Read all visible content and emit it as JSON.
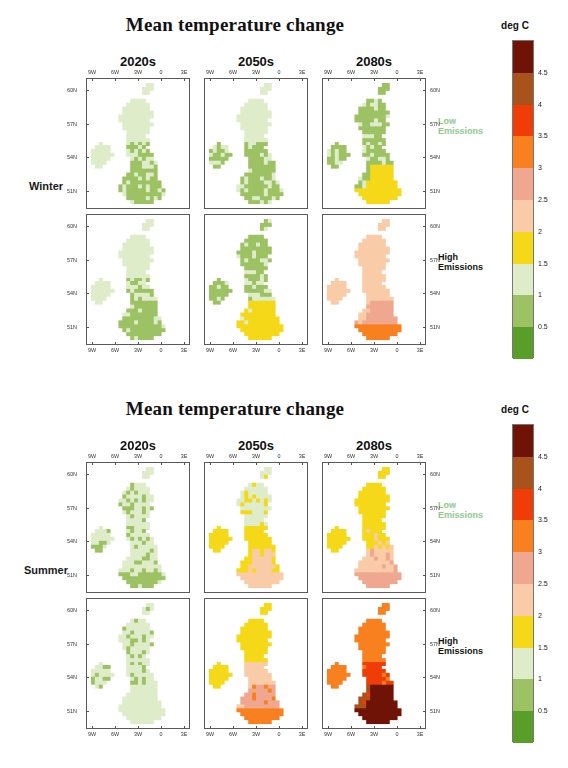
{
  "figures": [
    {
      "id": "winter",
      "title": "Mean temperature change",
      "season_label": "Winter",
      "column_titles": [
        "2020s",
        "2050s",
        "2080s"
      ],
      "row_labels": [
        {
          "text": "Low\nEmissions",
          "style": "low"
        },
        {
          "text": "High\nEmissions",
          "style": "high"
        }
      ],
      "x_ticks": [
        "9W",
        "6W",
        "3W",
        "0",
        "3E"
      ],
      "y_ticks": [
        "60N",
        "57N",
        "54N",
        "51N"
      ],
      "colorbar": {
        "title": "deg C",
        "tick_labels": [
          "4.5",
          "4",
          "3.5",
          "3",
          "2.5",
          "2",
          "1.5",
          "1",
          "0.5"
        ],
        "colors": [
          "#6e1305",
          "#a7531b",
          "#f03c06",
          "#f8801f",
          "#efa88f",
          "#f9cba6",
          "#f5d817",
          "#dfecca",
          "#9cc263",
          "#5a9e2a"
        ]
      }
    },
    {
      "id": "summer",
      "title": "Mean temperature change",
      "season_label": "Summer",
      "column_titles": [
        "2020s",
        "2050s",
        "2080s"
      ],
      "row_labels": [
        {
          "text": "Low\nEmissions",
          "style": "low"
        },
        {
          "text": "High\nEmissions",
          "style": "high"
        }
      ],
      "x_ticks": [
        "9W",
        "6W",
        "3W",
        "0",
        "3E"
      ],
      "y_ticks": [
        "60N",
        "57N",
        "54N",
        "51N"
      ],
      "colorbar": {
        "title": "deg C",
        "tick_labels": [
          "4.5",
          "4",
          "3.5",
          "3",
          "2.5",
          "2",
          "1.5",
          "1",
          "0.5"
        ],
        "colors": [
          "#6e1305",
          "#a7531b",
          "#f03c06",
          "#f8801f",
          "#efa88f",
          "#f9cba6",
          "#f5d817",
          "#dfecca",
          "#9cc263",
          "#5a9e2a"
        ]
      }
    }
  ],
  "chart_data": {
    "type": "heatmap",
    "title": "Mean temperature change",
    "subtitle": "UK mean temperature change maps by season, emissions scenario and time period",
    "xlabel": "Longitude",
    "ylabel": "Latitude",
    "zlabel": "deg C",
    "xlim": [
      -11.0,
      3.0
    ],
    "ylim": [
      49.5,
      61.5
    ],
    "x_tick_values": [
      -9,
      -6,
      -3,
      0,
      3
    ],
    "x_tick_labels": [
      "9W",
      "6W",
      "3W",
      "0",
      "3E"
    ],
    "y_tick_values": [
      60,
      57,
      54,
      51
    ],
    "y_tick_labels": [
      "60N",
      "57N",
      "54N",
      "51N"
    ],
    "grid": false,
    "legend_position": "right",
    "colorbar": {
      "boundaries": [
        0,
        0.5,
        1,
        1.5,
        2,
        2.5,
        3,
        3.5,
        4,
        4.5,
        5
      ],
      "tick_labels": [
        "0.5",
        "1",
        "1.5",
        "2",
        "2.5",
        "3",
        "3.5",
        "4",
        "4.5"
      ],
      "colors_low_to_high": [
        "#5a9e2a",
        "#9cc263",
        "#dfecca",
        "#f5d817",
        "#f9cba6",
        "#efa88f",
        "#f8801f",
        "#f03c06",
        "#a7531b",
        "#6e1305"
      ],
      "units": "deg C"
    },
    "rows": [
      "Low Emissions",
      "High Emissions"
    ],
    "columns": [
      "2020s",
      "2050s",
      "2080s"
    ],
    "panels": [
      {
        "season": "Winter",
        "emissions": "Low Emissions",
        "period": "2020s",
        "range_deg_c": [
          0.5,
          1.5
        ],
        "regional_values": {
          "Scotland": 1.2,
          "Northern Ireland": 1.2,
          "Northern England": 1.0,
          "Wales": 0.9,
          "Midlands": 0.9,
          "Southern England": 0.9
        }
      },
      {
        "season": "Winter",
        "emissions": "Low Emissions",
        "period": "2050s",
        "range_deg_c": [
          0.5,
          1.5
        ],
        "regional_values": {
          "Scotland": 1.2,
          "Northern Ireland": 1.0,
          "Northern England": 0.9,
          "Wales": 0.9,
          "Midlands": 0.9,
          "Southern England": 0.9
        }
      },
      {
        "season": "Winter",
        "emissions": "Low Emissions",
        "period": "2080s",
        "range_deg_c": [
          0.5,
          2.0
        ],
        "regional_values": {
          "Scotland": 0.9,
          "Northern Ireland": 0.9,
          "Northern England": 0.9,
          "Wales": 0.9,
          "Midlands": 1.7,
          "Southern England": 1.8
        }
      },
      {
        "season": "Winter",
        "emissions": "High Emissions",
        "period": "2020s",
        "range_deg_c": [
          0.5,
          1.5
        ],
        "regional_values": {
          "Scotland": 1.2,
          "Northern Ireland": 1.3,
          "Northern England": 1.0,
          "Wales": 0.9,
          "Midlands": 0.9,
          "Southern England": 0.9
        }
      },
      {
        "season": "Winter",
        "emissions": "High Emissions",
        "period": "2050s",
        "range_deg_c": [
          0.5,
          2.0
        ],
        "regional_values": {
          "Scotland": 0.9,
          "Northern Ireland": 0.9,
          "Northern England": 1.0,
          "Wales": 1.6,
          "Midlands": 1.7,
          "Southern England": 1.8
        }
      },
      {
        "season": "Winter",
        "emissions": "High Emissions",
        "period": "2080s",
        "range_deg_c": [
          1.5,
          3.5
        ],
        "regional_values": {
          "Scotland": 2.2,
          "Northern Ireland": 2.2,
          "Northern England": 2.3,
          "Wales": 2.4,
          "Midlands": 2.7,
          "Southern England": 3.2
        }
      },
      {
        "season": "Summer",
        "emissions": "Low Emissions",
        "period": "2020s",
        "range_deg_c": [
          0.5,
          1.5
        ],
        "regional_values": {
          "Scotland": 1.1,
          "Northern Ireland": 1.1,
          "Northern England": 1.1,
          "Wales": 1.1,
          "Midlands": 1.1,
          "Southern England": 0.9
        }
      },
      {
        "season": "Summer",
        "emissions": "Low Emissions",
        "period": "2050s",
        "range_deg_c": [
          1.0,
          2.5
        ],
        "regional_values": {
          "Scotland": 1.4,
          "Northern Ireland": 1.7,
          "Northern England": 1.8,
          "Wales": 1.8,
          "Midlands": 2.1,
          "Southern England": 2.3
        }
      },
      {
        "season": "Summer",
        "emissions": "Low Emissions",
        "period": "2080s",
        "range_deg_c": [
          1.5,
          3.0
        ],
        "regional_values": {
          "Scotland": 1.8,
          "Northern Ireland": 1.8,
          "Northern England": 1.9,
          "Wales": 2.3,
          "Midlands": 2.4,
          "Southern England": 2.8
        }
      },
      {
        "season": "Summer",
        "emissions": "High Emissions",
        "period": "2020s",
        "range_deg_c": [
          0.5,
          1.5
        ],
        "regional_values": {
          "Scotland": 1.1,
          "Northern Ireland": 1.1,
          "Northern England": 1.1,
          "Wales": 1.1,
          "Midlands": 1.2,
          "Southern England": 1.2
        }
      },
      {
        "season": "Summer",
        "emissions": "High Emissions",
        "period": "2050s",
        "range_deg_c": [
          1.5,
          3.5
        ],
        "regional_values": {
          "Scotland": 1.8,
          "Northern Ireland": 1.8,
          "Northern England": 2.2,
          "Wales": 2.6,
          "Midlands": 2.9,
          "Southern England": 3.3
        }
      },
      {
        "season": "Summer",
        "emissions": "High Emissions",
        "period": "2080s",
        "range_deg_c": [
          2.5,
          5.0
        ],
        "regional_values": {
          "Scotland": 3.2,
          "Northern Ireland": 3.2,
          "Northern England": 3.6,
          "Wales": 4.1,
          "Midlands": 4.7,
          "Southern England": 4.8
        }
      }
    ]
  }
}
